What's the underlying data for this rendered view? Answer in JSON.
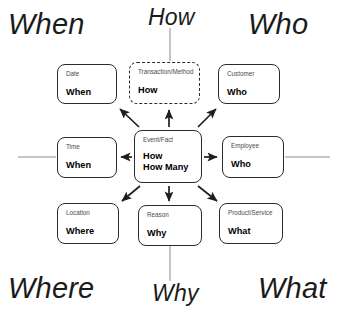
{
  "diagram": {
    "colors": {
      "stroke": "#2b2b2b",
      "thin_line": "#8c8c8c",
      "title_text": "#4a4a4a",
      "value_text": "#000000",
      "quadrant_text": "#1b1b1b",
      "background": "#ffffff"
    },
    "quadrant_labels": [
      {
        "id": "when",
        "text": "When",
        "position": "top-left"
      },
      {
        "id": "how",
        "text": "How",
        "position": "top-center"
      },
      {
        "id": "who",
        "text": "Who",
        "position": "top-right"
      },
      {
        "id": "where",
        "text": "Where",
        "position": "bottom-left"
      },
      {
        "id": "why",
        "text": "Why",
        "position": "bottom-center"
      },
      {
        "id": "what",
        "text": "What",
        "position": "bottom-right"
      }
    ],
    "center": {
      "title": "Event/Fact",
      "value_line1": "How",
      "value_line2": "How Many"
    },
    "nodes": [
      {
        "id": "date",
        "title": "Date",
        "value": "When",
        "border": "solid",
        "position": "top-left"
      },
      {
        "id": "transaction",
        "title": "Transaction/Method",
        "value": "How",
        "border": "dashed",
        "position": "top-center"
      },
      {
        "id": "customer",
        "title": "Customer",
        "value": "Who",
        "border": "solid",
        "position": "top-right"
      },
      {
        "id": "time",
        "title": "Time",
        "value": "When",
        "border": "solid",
        "position": "middle-left"
      },
      {
        "id": "employee",
        "title": "Employee",
        "value": "Who",
        "border": "solid",
        "position": "middle-right"
      },
      {
        "id": "location",
        "title": "Location",
        "value": "Where",
        "border": "solid",
        "position": "bottom-left"
      },
      {
        "id": "reason",
        "title": "Reason",
        "value": "Why",
        "border": "solid",
        "position": "bottom-center"
      },
      {
        "id": "product",
        "title": "Product/Service",
        "value": "What",
        "border": "solid",
        "position": "bottom-right"
      }
    ],
    "connectors": [
      {
        "from": "event",
        "to": "date",
        "style": "arrow",
        "direction": "up-left"
      },
      {
        "from": "event",
        "to": "transaction",
        "style": "arrow",
        "direction": "up"
      },
      {
        "from": "event",
        "to": "customer",
        "style": "arrow",
        "direction": "up-right"
      },
      {
        "from": "event",
        "to": "time",
        "style": "arrow",
        "direction": "left"
      },
      {
        "from": "event",
        "to": "employee",
        "style": "arrow",
        "direction": "right"
      },
      {
        "from": "event",
        "to": "location",
        "style": "arrow",
        "direction": "down-left"
      },
      {
        "from": "event",
        "to": "reason",
        "style": "arrow",
        "direction": "down"
      },
      {
        "from": "event",
        "to": "product",
        "style": "arrow",
        "direction": "down-right"
      },
      {
        "from": "transaction",
        "to": "how-label",
        "style": "plain-line",
        "direction": "up"
      },
      {
        "from": "reason",
        "to": "why-label",
        "style": "plain-line",
        "direction": "down"
      },
      {
        "from": "time",
        "to": "left-edge",
        "style": "plain-line",
        "direction": "left"
      },
      {
        "from": "employee",
        "to": "right-edge",
        "style": "plain-line",
        "direction": "right"
      }
    ]
  }
}
